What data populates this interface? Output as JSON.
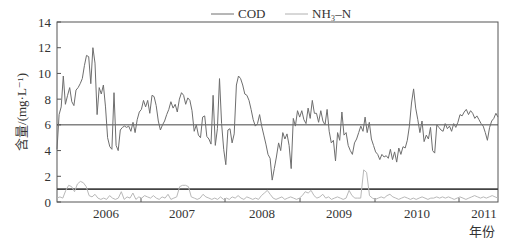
{
  "chart_data": {
    "type": "line",
    "title": "",
    "xlabel": "年份",
    "ylabel": "含量/(mg·L⁻¹)",
    "ylim": [
      0,
      14
    ],
    "yticks": [
      0,
      2,
      4,
      6,
      8,
      10,
      12,
      14
    ],
    "xlim": [
      "2005-07",
      "2011-04"
    ],
    "xtick_labels": [
      "2006",
      "2007",
      "2008",
      "2009",
      "2010",
      "2011"
    ],
    "grid": false,
    "legend": {
      "position": "top-center",
      "entries": [
        "COD",
        "NH₃–N"
      ]
    },
    "reference_lines": [
      {
        "value": 6,
        "label": "COD standard"
      },
      {
        "value": 1,
        "label": "NH₃–N standard"
      }
    ],
    "series": [
      {
        "name": "COD",
        "color": "#707070",
        "values": [
          4.1,
          6.8,
          7.4,
          9.8,
          7.6,
          8.3,
          8.9,
          7.8,
          7.5,
          8.7,
          8.9,
          9.2,
          9.6,
          10.6,
          11.4,
          11.3,
          9.2,
          12.0,
          10.8,
          6.8,
          8.9,
          8.4,
          9.1,
          7.4,
          5.0,
          4.3,
          4.1,
          8.5,
          4.4,
          4.0,
          5.6,
          5.8,
          5.9,
          5.8,
          5.9,
          5.5,
          6.2,
          5.4,
          6.4,
          7.0,
          7.2,
          7.9,
          7.4,
          7.9,
          6.9,
          8.3,
          8.2,
          7.5,
          6.3,
          5.6,
          6.0,
          6.3,
          6.8,
          7.2,
          7.8,
          7.3,
          7.6,
          7.0,
          8.0,
          8.5,
          8.3,
          7.6,
          8.1,
          7.9,
          7.1,
          5.5,
          6.0,
          5.2,
          5.0,
          6.6,
          6.7,
          5.1,
          4.9,
          4.5,
          8.3,
          4.4,
          5.7,
          9.6,
          6.1,
          4.1,
          2.9,
          5.6,
          5.7,
          4.6,
          5.3,
          9.1,
          9.8,
          9.6,
          9.1,
          8.4,
          8.3,
          7.9,
          7.2,
          6.4,
          5.9,
          6.1,
          6.8,
          5.9,
          5.2,
          4.5,
          3.7,
          3.4,
          1.7,
          2.6,
          3.5,
          4.6,
          4.0,
          5.4,
          4.9,
          5.3,
          4.4,
          2.6,
          6.5,
          5.9,
          7.1,
          6.6,
          7.1,
          6.4,
          6.1,
          7.3,
          6.5,
          7.9,
          6.9,
          6.9,
          6.2,
          7.1,
          6.3,
          6.0,
          7.2,
          5.5,
          4.6,
          4.8,
          3.2,
          5.4,
          4.8,
          7.0,
          5.2,
          5.4,
          4.4,
          4.0,
          3.7,
          4.6,
          4.9,
          5.4,
          5.9,
          5.5,
          6.6,
          5.4,
          6.2,
          4.9,
          4.4,
          3.9,
          3.7,
          3.3,
          3.7,
          3.5,
          3.6,
          3.4,
          4.1,
          3.3,
          3.9,
          3.1,
          4.2,
          3.7,
          4.3,
          4.2,
          4.8,
          5.9,
          7.7,
          8.8,
          7.3,
          6.4,
          5.4,
          6.3,
          4.7,
          5.2,
          4.9,
          5.8,
          4.0,
          3.8,
          6.0,
          5.8,
          5.6,
          5.5,
          6.1,
          5.7,
          5.9,
          5.5,
          6.1,
          5.8,
          6.2,
          6.8,
          6.7,
          7.0,
          7.2,
          6.8,
          7.1,
          6.9,
          6.5,
          6.7,
          6.4,
          6.1,
          5.9,
          5.4,
          4.8,
          5.8,
          6.3,
          6.5,
          6.9,
          6.6
        ]
      },
      {
        "name": "NH₃–N",
        "color": "#b4b4b4",
        "values": [
          0.3,
          0.4,
          0.3,
          0.9,
          1.3,
          1.2,
          0.8,
          1.4,
          1.6,
          1.5,
          1.2,
          0.5,
          0.4,
          0.6,
          0.3,
          0.2,
          0.3,
          0.2,
          0.5,
          0.3,
          0.2,
          0.3,
          0.8,
          0.2,
          0.4,
          0.3,
          0.7,
          0.2,
          0.4,
          0.3,
          0.5,
          0.4,
          0.3,
          0.5,
          0.3,
          0.2,
          0.4,
          0.3,
          0.6,
          0.2,
          0.3,
          0.4,
          1.2,
          1.3,
          1.3,
          1.2,
          0.4,
          0.3,
          0.2,
          0.3,
          0.6,
          0.4,
          0.3,
          0.2,
          0.3,
          0.2,
          0.4,
          0.2,
          0.3,
          0.2,
          0.4,
          0.3,
          0.5,
          0.3,
          0.2,
          0.4,
          0.3,
          0.2,
          0.3,
          0.2,
          0.5,
          0.7,
          0.9,
          0.6,
          0.3,
          0.2,
          0.3,
          0.4,
          0.2,
          0.3,
          0.4,
          0.3,
          0.2,
          0.3,
          0.5,
          0.8,
          0.7,
          0.9,
          0.5,
          0.3,
          0.4,
          0.6,
          0.3,
          0.4,
          0.2,
          0.3,
          0.4,
          0.3,
          0.2,
          0.3,
          0.9,
          0.5,
          0.3,
          0.3,
          0.3,
          2.5,
          2.3,
          0.5,
          0.3,
          0.2,
          0.3,
          0.4,
          0.3,
          0.5,
          0.6,
          0.4,
          0.3,
          0.2,
          0.3,
          0.4,
          0.3,
          0.2,
          0.3,
          0.2,
          0.3,
          0.4,
          0.3,
          0.2,
          0.3,
          0.3,
          0.4,
          0.3,
          0.4,
          0.3,
          0.4,
          0.3,
          0.2,
          0.3,
          0.4,
          0.3,
          0.2,
          0.3,
          0.4,
          0.5,
          0.4,
          0.3,
          0.4,
          0.3,
          0.4,
          0.5,
          0.4,
          0.3
        ]
      }
    ]
  },
  "axes": {
    "y_title": "含量/(mg·L⁻¹)",
    "x_title": "年份"
  },
  "legend": {
    "cod_label": "COD",
    "nh3_label": "NH₃–N"
  }
}
